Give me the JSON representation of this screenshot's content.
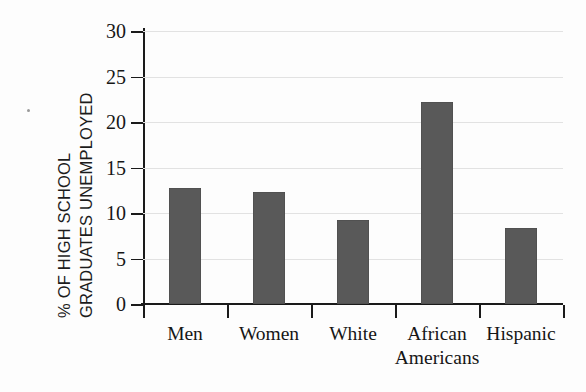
{
  "chart_data": {
    "type": "bar",
    "title": "",
    "xlabel": "",
    "ylabel": "% OF HIGH SCHOOL GRADUATES UNEMPLOYED",
    "ylabel_lines": [
      "% OF HIGH SCHOOL",
      "GRADUATES UNEMPLOYED"
    ],
    "categories": [
      "Men",
      "Women",
      "White",
      "African Americans",
      "Hispanic"
    ],
    "category_lines": [
      [
        "Men"
      ],
      [
        "Women"
      ],
      [
        "White"
      ],
      [
        "African",
        "Americans"
      ],
      [
        "Hispanic"
      ]
    ],
    "values": [
      12.7,
      12.3,
      9.2,
      22.2,
      8.3
    ],
    "ylim": [
      0,
      30
    ],
    "yticks": [
      0,
      5,
      10,
      15,
      20,
      25,
      30
    ],
    "ytick_labels": [
      "0",
      "5",
      "10",
      "15",
      "20",
      "25",
      "30"
    ],
    "grid": true,
    "grid_axis": "y",
    "legend": "none",
    "bar_color": "#595959",
    "grid_color": "#e2e2e2",
    "axis_color": "#1a1a1a",
    "background_color": "#fdfdfd"
  }
}
